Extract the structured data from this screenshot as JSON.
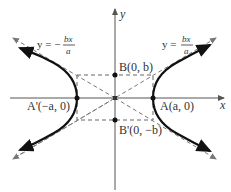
{
  "diagram": {
    "type": "hyperbola",
    "equation_form": "x^2/a^2 - y^2/b^2 = 1",
    "axes": {
      "x_label": "x",
      "y_label": "y"
    },
    "points": {
      "A": {
        "label": "A(a, 0)",
        "name": "A",
        "coords": "(a, 0)"
      },
      "A_prime": {
        "label": "A'(−a, 0)",
        "name": "A'",
        "coords": "(−a, 0)"
      },
      "B": {
        "label": "B(0, b)",
        "name": "B",
        "coords": "(0, b)"
      },
      "B_prime": {
        "label": "B'(0, −b)",
        "name": "B'",
        "coords": "(0, −b)"
      }
    },
    "asymptotes": {
      "positive": {
        "lhs": "y =",
        "num": "bx",
        "den": "a"
      },
      "negative": {
        "lhs": "y = −",
        "num": "bx",
        "den": "a"
      }
    },
    "colors": {
      "curve": "#111111",
      "axes": "#555555",
      "dashed": "#666666",
      "text": "#333333"
    }
  }
}
